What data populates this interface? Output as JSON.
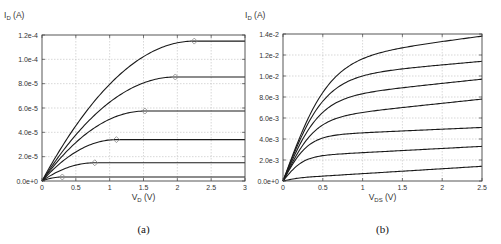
{
  "chart_data": [
    {
      "id": "a",
      "type": "line",
      "caption": "(a)",
      "title": "",
      "ylabel_main": "I",
      "ylabel_sub": "D",
      "ylabel_unit": " (A)",
      "xlabel_main": "V",
      "xlabel_sub": "D",
      "xlabel_unit": " (V)",
      "xlim": [
        0,
        3
      ],
      "ylim": [
        0,
        0.00012
      ],
      "xticks": [
        0,
        0.5,
        1,
        1.5,
        2,
        2.5,
        3
      ],
      "xtick_labels": [
        "0",
        "0.5",
        "1",
        "1.5",
        "2",
        "2.5",
        "3"
      ],
      "yticks": [
        0,
        2e-05,
        4e-05,
        6e-05,
        8e-05,
        0.0001,
        0.00012
      ],
      "ytick_labels": [
        "0.0e+0",
        "2.0e-5",
        "4.0e-5",
        "6.0e-5",
        "8.0e-5",
        "1.0e-4",
        "1.2e-4"
      ],
      "grid": true,
      "legend": "none",
      "series": [
        {
          "name": "curve 1",
          "vsat": 0.3,
          "isat": 3.3e-06
        },
        {
          "name": "curve 2",
          "vsat": 0.78,
          "isat": 1.5e-05
        },
        {
          "name": "curve 3",
          "vsat": 1.1,
          "isat": 3.4e-05
        },
        {
          "name": "curve 4",
          "vsat": 1.52,
          "isat": 5.75e-05
        },
        {
          "name": "curve 5",
          "vsat": 1.97,
          "isat": 8.55e-05
        },
        {
          "name": "curve 6",
          "vsat": 2.25,
          "isat": 0.000115
        }
      ],
      "markers": {
        "shape": "diamond",
        "note": "open diamond at saturation onset (V_D = V_sat) of each curve"
      },
      "plot_box": {
        "x0": 42,
        "y0": 35,
        "x1": 245,
        "y1": 181
      }
    },
    {
      "id": "b",
      "type": "line",
      "caption": "(b)",
      "title": "",
      "ylabel_main": "I",
      "ylabel_sub": "D",
      "ylabel_unit": " (A)",
      "xlabel_main": "V",
      "xlabel_sub": "DS",
      "xlabel_unit": " (V)",
      "xlim": [
        0,
        2.5
      ],
      "ylim": [
        0,
        0.014
      ],
      "xticks": [
        0,
        0.5,
        1,
        1.5,
        2,
        2.5
      ],
      "xtick_labels": [
        "0",
        "0.5",
        "1",
        "1.5",
        "2",
        "2.5"
      ],
      "yticks": [
        0,
        0.002,
        0.004,
        0.006,
        0.008,
        0.01,
        0.012,
        0.014
      ],
      "ytick_labels": [
        "0.0e+0",
        "2.0e-3",
        "4.0e-3",
        "6.0e-3",
        "8.0e-3",
        "1.0e-2",
        "1.2e-2",
        "1.4e-2"
      ],
      "grid": true,
      "legend": "none",
      "series": [
        {
          "name": "curve 1",
          "knee": 0.25,
          "i_at_1V": 0.0007,
          "i_at_2_5V": 0.0014
        },
        {
          "name": "curve 2",
          "knee": 0.4,
          "i_at_1V": 0.0027,
          "i_at_2_5V": 0.0033
        },
        {
          "name": "curve 3",
          "knee": 0.5,
          "i_at_1V": 0.0046,
          "i_at_2_5V": 0.0051
        },
        {
          "name": "curve 4",
          "knee": 0.62,
          "i_at_1V": 0.0066,
          "i_at_2_5V": 0.0078
        },
        {
          "name": "curve 5",
          "knee": 0.72,
          "i_at_1V": 0.0085,
          "i_at_2_5V": 0.0097
        },
        {
          "name": "curve 6",
          "knee": 0.82,
          "i_at_1V": 0.0104,
          "i_at_2_5V": 0.0114
        },
        {
          "name": "curve 7",
          "knee": 0.9,
          "i_at_1V": 0.0123,
          "i_at_2_5V": 0.0138
        }
      ],
      "plot_box": {
        "x0": 283,
        "y0": 34,
        "x1": 482,
        "y1": 181
      }
    }
  ]
}
